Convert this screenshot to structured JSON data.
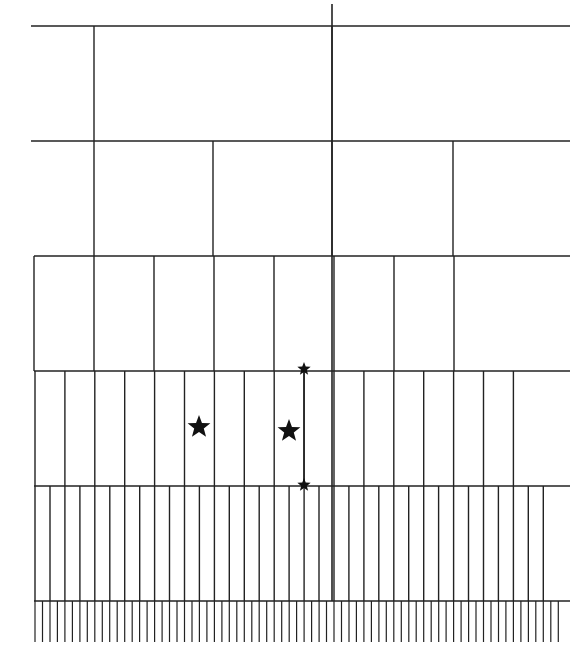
{
  "diagram": {
    "type": "hierarchical-grid",
    "stroke_color": "#222222",
    "star_color": "#111111",
    "x_left": 31,
    "x_right": 570,
    "main_axis": {
      "x": 332,
      "y_top": 4,
      "y_bottom": 601
    },
    "levels": [
      {
        "y_top": 26,
        "y_bottom": 141,
        "x_start": 31,
        "verticals": [
          94,
          332
        ]
      },
      {
        "y_top": 141,
        "y_bottom": 256,
        "x_start": 31,
        "verticals": [
          94,
          213,
          332,
          453
        ]
      },
      {
        "y_top": 256,
        "y_bottom": 371,
        "x_start": 34,
        "step": 60,
        "from": 34,
        "to": 513
      },
      {
        "y_top": 371,
        "y_bottom": 486,
        "x_start": 34,
        "step": 29.9,
        "from": 35,
        "to": 541
      },
      {
        "y_top": 486,
        "y_bottom": 601,
        "x_start": 34,
        "step": 14.95,
        "from": 35,
        "to": 556
      },
      {
        "y_top": 601,
        "y_bottom": 642,
        "x_start": 34,
        "step": 7.475,
        "from": 35,
        "to": 564
      }
    ],
    "connector": {
      "x": 304,
      "y_top": 369,
      "y_bottom": 485
    },
    "stars": [
      {
        "name": "large-star-left",
        "x": 199,
        "y": 427,
        "size": 12
      },
      {
        "name": "large-star-right",
        "x": 289,
        "y": 431,
        "size": 12
      },
      {
        "name": "small-star-top",
        "x": 304,
        "y": 369,
        "size": 7
      },
      {
        "name": "small-star-bottom",
        "x": 304,
        "y": 485,
        "size": 7
      }
    ]
  }
}
